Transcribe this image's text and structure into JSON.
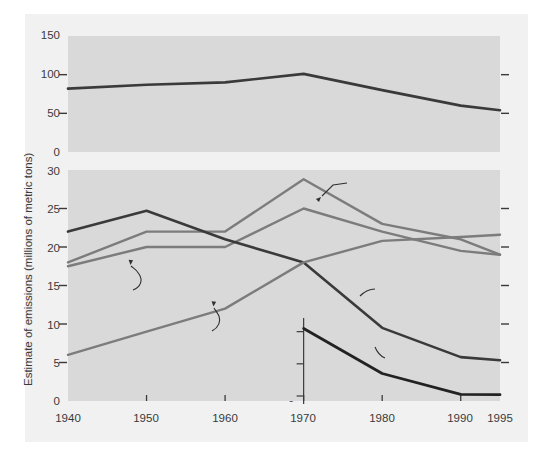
{
  "figure": {
    "background": "#f1f1f1",
    "plot_background": "#d9d9d9",
    "axis_title": "Estimate of emissions (millions of metric tons)",
    "inset_axis_title": "(Thousands of\nmetric tons)"
  },
  "colors": {
    "dark_series": "#3a3a3a",
    "gray_series": "#7c7c7c",
    "text": "#3a3a3a",
    "plot_bg": "#d9d9d9",
    "page_bg": "#f1f1f1"
  },
  "top_axis": {
    "ticks": [
      "0",
      "50",
      "100",
      "150"
    ],
    "values": [
      0,
      50,
      100,
      150
    ]
  },
  "bottom_axis": {
    "ticks": [
      "0",
      "5",
      "10",
      "15",
      "20",
      "25",
      "30"
    ],
    "values": [
      0,
      5,
      10,
      15,
      20,
      25,
      30
    ]
  },
  "inset_axis": {
    "ticks": [
      "0",
      "100",
      "200"
    ],
    "values": [
      0,
      100,
      200
    ]
  },
  "x_axis": {
    "ticks": [
      "1940",
      "1950",
      "1960",
      "1970",
      "1980",
      "1990",
      "1995"
    ],
    "values": [
      1940,
      1950,
      1960,
      1970,
      1980,
      1990,
      1995
    ]
  },
  "annotations": {
    "carbon_monoxide": "Carbon monoxide",
    "sulfur_dioxide": "Sulfur dioxide",
    "volatile_organic_compounds": "Volatile\norganic\ncompounds",
    "nitrogen_dioxide": "Nitrogen\ndioxide",
    "particulate_matter": "Particulate\nmatter",
    "lead": "Lead"
  },
  "chart_data": [
    {
      "type": "line",
      "panel": "top",
      "title": "",
      "xlabel": "",
      "ylabel": "Estimate of emissions (millions of metric tons)",
      "xlim": [
        1940,
        1995
      ],
      "ylim": [
        0,
        150
      ],
      "grid": false,
      "legend": "inline-annotation",
      "x": [
        1940,
        1950,
        1960,
        1970,
        1980,
        1990,
        1995
      ],
      "series": [
        {
          "name": "Carbon monoxide",
          "color": "#3a3a3a",
          "unit": "millions of metric tons",
          "values": [
            82,
            87,
            90,
            101,
            80,
            60,
            54
          ]
        }
      ]
    },
    {
      "type": "line",
      "panel": "bottom",
      "title": "",
      "xlabel": "",
      "ylabel": "Estimate of emissions (millions of metric tons)",
      "xlim": [
        1940,
        1995
      ],
      "ylim": [
        0,
        30
      ],
      "grid": false,
      "legend": "inline-annotation",
      "x": [
        1940,
        1950,
        1960,
        1970,
        1980,
        1990,
        1995
      ],
      "series": [
        {
          "name": "Sulfur dioxide",
          "color": "#7c7c7c",
          "unit": "millions of metric tons",
          "values": [
            18.0,
            22.0,
            22.0,
            28.8,
            23.0,
            21.0,
            19.0
          ]
        },
        {
          "name": "Volatile organic compounds",
          "color": "#7c7c7c",
          "unit": "millions of metric tons",
          "values": [
            17.5,
            20.0,
            20.0,
            25.0,
            22.0,
            19.5,
            19.0
          ]
        },
        {
          "name": "Particulate matter",
          "color": "#3a3a3a",
          "unit": "millions of metric tons",
          "values": [
            22.0,
            24.7,
            21.0,
            18.0,
            9.5,
            5.7,
            5.3
          ]
        },
        {
          "name": "Nitrogen dioxide",
          "color": "#7c7c7c",
          "unit": "millions of metric tons",
          "values": [
            6.0,
            9.0,
            12.0,
            18.0,
            20.8,
            21.3,
            21.6
          ]
        }
      ],
      "inset_series": [
        {
          "name": "Lead",
          "color": "#222222",
          "unit": "thousands of metric tons",
          "ylim": [
            0,
            230
          ],
          "x": [
            1970,
            1980,
            1990,
            1995
          ],
          "values": [
            210,
            70,
            5,
            4
          ]
        }
      ]
    }
  ]
}
